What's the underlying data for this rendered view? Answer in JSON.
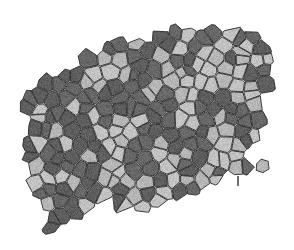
{
  "figure": {
    "title": "Two-phase polycrystalline grain mosaic",
    "caption": "Irregular Voronoi tessellation of light and dark gray grains on a white background",
    "width": 294,
    "height": 250,
    "background_color": "#ffffff"
  },
  "style": {
    "light_cell_color": "#b6b6b6",
    "dark_cell_color": "#5e5e5e",
    "light_cell_color_alt": "#c2c2c2",
    "dark_cell_color_alt": "#676767",
    "outline_color": "#2b2b2b",
    "outline_width": 0.9,
    "texture_noise_opacity": 0.16,
    "mean_cell_diameter_px": 14
  },
  "region": {
    "shape": "irregular blob",
    "description": "Tessellated area spans roughly x 20-280, y 25-235; top edge rises left-to-right, bottom edge rises left-to-right, right side tapers to a point near x 265, y 160",
    "outline_polygon": [
      [
        28,
        118
      ],
      [
        22,
        104
      ],
      [
        34,
        88
      ],
      [
        46,
        78
      ],
      [
        58,
        70
      ],
      [
        74,
        60
      ],
      [
        92,
        50
      ],
      [
        112,
        42
      ],
      [
        134,
        36
      ],
      [
        156,
        32
      ],
      [
        178,
        30
      ],
      [
        198,
        28
      ],
      [
        216,
        26
      ],
      [
        234,
        28
      ],
      [
        250,
        32
      ],
      [
        262,
        40
      ],
      [
        272,
        52
      ],
      [
        276,
        64
      ],
      [
        272,
        78
      ],
      [
        264,
        90
      ],
      [
        268,
        104
      ],
      [
        272,
        118
      ],
      [
        266,
        132
      ],
      [
        254,
        146
      ],
      [
        240,
        156
      ],
      [
        250,
        168
      ],
      [
        238,
        176
      ],
      [
        222,
        180
      ],
      [
        206,
        186
      ],
      [
        190,
        196
      ],
      [
        174,
        206
      ],
      [
        158,
        212
      ],
      [
        140,
        212
      ],
      [
        124,
        206
      ],
      [
        108,
        200
      ],
      [
        96,
        208
      ],
      [
        84,
        220
      ],
      [
        70,
        230
      ],
      [
        56,
        232
      ],
      [
        46,
        224
      ],
      [
        40,
        210
      ],
      [
        36,
        196
      ],
      [
        30,
        182
      ],
      [
        24,
        168
      ],
      [
        20,
        154
      ],
      [
        24,
        136
      ]
    ]
  },
  "cells": {
    "count": 268,
    "phases": [
      {
        "name": "light-grain",
        "color": "#b6b6b6",
        "fraction": 0.48
      },
      {
        "name": "dark-grain",
        "color": "#5e5e5e",
        "fraction": 0.52
      }
    ],
    "seed": 20240817,
    "jitter": 0.42
  },
  "artifacts": [
    {
      "name": "detached-grain-right",
      "x": 262,
      "y": 166,
      "radius": 7,
      "color": "#b6b6b6"
    },
    {
      "name": "stray-mark",
      "x": 237,
      "y": 176,
      "width": 2,
      "height": 10,
      "color": "#6e6e6e"
    }
  ]
}
